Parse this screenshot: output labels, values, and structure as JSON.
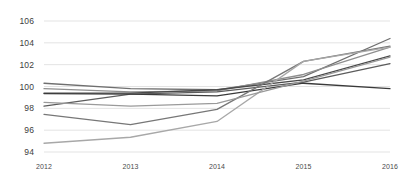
{
  "chart_data": {
    "type": "line",
    "title": "",
    "subtitle": "",
    "xlabel": "",
    "ylabel": "",
    "x": [
      2012,
      2013,
      2014,
      2015,
      2016
    ],
    "categories": [
      "2012",
      "2013",
      "2014",
      "2015",
      "2016"
    ],
    "xtick_labels": [
      "2012",
      "2013",
      "2014",
      "2015",
      "2016"
    ],
    "ytick_labels": [
      "94",
      "96",
      "98",
      "100",
      "102",
      "104",
      "106"
    ],
    "ytick_values": [
      94,
      96,
      98,
      100,
      102,
      104,
      106
    ],
    "ylim": [
      94,
      106
    ],
    "xlim": [
      2012,
      2016
    ],
    "grid": "horizontal",
    "legend": "none",
    "legend_position": "none",
    "series": [
      {
        "name": "series-1",
        "color": "#6f6f6f",
        "values": [
          100.3,
          99.8,
          99.7,
          100.9,
          104.4
        ]
      },
      {
        "name": "series-2",
        "color": "#8f8f8f",
        "values": [
          99.8,
          99.5,
          99.6,
          101.1,
          103.6
        ]
      },
      {
        "name": "series-3",
        "color": "#4a4a4a",
        "values": [
          99.4,
          99.4,
          99.7,
          100.6,
          102.8
        ]
      },
      {
        "name": "series-4",
        "color": "#5c5c5c",
        "values": [
          98.2,
          99.3,
          99.5,
          100.4,
          102.1
        ]
      },
      {
        "name": "series-5",
        "color": "#3a3a3a",
        "values": [
          99.35,
          99.3,
          99.15,
          100.3,
          99.8
        ]
      },
      {
        "name": "series-6",
        "color": "#777777",
        "values": [
          97.45,
          96.5,
          97.9,
          102.3,
          103.7
        ]
      },
      {
        "name": "series-7",
        "color": "#a8a8a8",
        "values": [
          94.8,
          95.35,
          96.8,
          102.3,
          103.6
        ]
      },
      {
        "name": "series-8",
        "color": "#9a9a9a",
        "values": [
          98.55,
          98.2,
          98.45,
          100.5,
          102.7
        ]
      }
    ],
    "colors": {
      "grid": "#e3e3e3",
      "axis_text": "#3d3d3d",
      "background": "#ffffff"
    }
  }
}
